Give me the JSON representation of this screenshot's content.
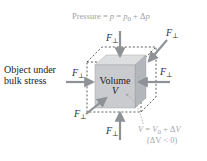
{
  "diagram": {
    "title": "Pressure = p = p0 + Δp",
    "title_parts": {
      "lhs": "Pressure = ",
      "p": "p",
      "eq2": " = ",
      "p0": "p",
      "p0_sub": "0",
      "plus": " + Δ",
      "dp": "p"
    },
    "object_label_line1": "Object under",
    "object_label_line2": "bulk stress",
    "cube_label_line1": "Volume",
    "cube_label_line2": "V",
    "force_symbol": "F",
    "force_subscript": "⊥",
    "volume_eqn_line1": "V = V0 + ΔV",
    "volume_eqn_parts": {
      "v": "V",
      "eq": " = ",
      "v0": "V",
      "v0_sub": "0",
      "plus": " + Δ",
      "dv": "V"
    },
    "volume_eqn_line2": "(ΔV < 0)",
    "colors": {
      "cube_front": "#c9cbce",
      "cube_top": "#dcdee0",
      "cube_side": "#b3b6ba",
      "arrow": "#8e9297",
      "dashed": "#333333",
      "annotation": "#a0a6ad"
    }
  }
}
